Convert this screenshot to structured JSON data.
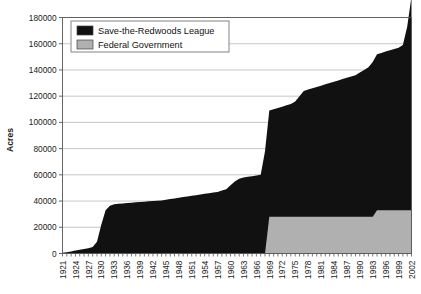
{
  "chart_data": {
    "type": "area",
    "title": "",
    "subtitle": "",
    "xlabel": "",
    "ylabel": "Acres",
    "stacked": true,
    "grid": true,
    "grid_axis": "y",
    "legend_position": "top-left",
    "xlim": [
      1921,
      2002
    ],
    "ylim": [
      0,
      180000
    ],
    "ytick_labels": [
      "0",
      "20000",
      "40000",
      "60000",
      "80000",
      "100000",
      "120000",
      "140000",
      "160000",
      "180000"
    ],
    "ytick_values": [
      0,
      20000,
      40000,
      60000,
      80000,
      100000,
      120000,
      140000,
      160000,
      180000
    ],
    "xtick_labels": [
      "1921",
      "1924",
      "1927",
      "1930",
      "1933",
      "1936",
      "1939",
      "1942",
      "1945",
      "1948",
      "1951",
      "1954",
      "1957",
      "1960",
      "1963",
      "1966",
      "1969",
      "1972",
      "1975",
      "1978",
      "1981",
      "1984",
      "1987",
      "1990",
      "1993",
      "1996",
      "1999",
      "2002"
    ],
    "xtick_interval": 3,
    "colors": {
      "save_the_redwoods_league": "#111111",
      "federal_government": "#b0b0b0",
      "grid": "#b8b8b8",
      "axis": "#555555",
      "background": "#ffffff"
    },
    "x": [
      1921,
      1922,
      1923,
      1924,
      1925,
      1926,
      1927,
      1928,
      1929,
      1930,
      1931,
      1932,
      1933,
      1934,
      1935,
      1936,
      1937,
      1938,
      1939,
      1940,
      1941,
      1942,
      1943,
      1944,
      1945,
      1946,
      1947,
      1948,
      1949,
      1950,
      1951,
      1952,
      1953,
      1954,
      1955,
      1956,
      1957,
      1958,
      1959,
      1960,
      1961,
      1962,
      1963,
      1964,
      1965,
      1966,
      1967,
      1968,
      1969,
      1970,
      1971,
      1972,
      1973,
      1974,
      1975,
      1976,
      1977,
      1978,
      1979,
      1980,
      1981,
      1982,
      1983,
      1984,
      1985,
      1986,
      1987,
      1988,
      1989,
      1990,
      1991,
      1992,
      1993,
      1994,
      1995,
      1996,
      1997,
      1998,
      1999,
      2000,
      2001,
      2002
    ],
    "series": [
      {
        "name": "Save-the-Redwoods League",
        "color": "#111111",
        "values": [
          500,
          900,
          1500,
          2200,
          2800,
          3400,
          4000,
          5000,
          9000,
          22000,
          33000,
          36500,
          37500,
          38000,
          38200,
          38500,
          38800,
          39000,
          39200,
          39500,
          39800,
          40000,
          40200,
          40500,
          41000,
          41500,
          42000,
          42500,
          43000,
          43500,
          44000,
          44500,
          45000,
          45500,
          46000,
          46500,
          47000,
          48000,
          49000,
          52000,
          55000,
          57000,
          58000,
          58500,
          59000,
          59500,
          60000,
          78000,
          81000,
          82000,
          83000,
          84000,
          85000,
          86000,
          88000,
          92000,
          96000,
          97000,
          98000,
          99000,
          100000,
          101000,
          102000,
          103000,
          104000,
          105000,
          106000,
          107000,
          108000,
          110000,
          112000,
          114000,
          118000,
          119000,
          120000,
          121000,
          122000,
          123000,
          124000,
          126000,
          140000,
          163000
        ]
      },
      {
        "name": "Federal Government",
        "color": "#b0b0b0",
        "values": [
          0,
          0,
          0,
          0,
          0,
          0,
          0,
          0,
          0,
          0,
          0,
          0,
          0,
          0,
          0,
          0,
          0,
          0,
          0,
          0,
          0,
          0,
          0,
          0,
          0,
          0,
          0,
          0,
          0,
          0,
          0,
          0,
          0,
          0,
          0,
          0,
          0,
          0,
          0,
          0,
          0,
          0,
          0,
          0,
          0,
          0,
          0,
          0,
          28000,
          28000,
          28000,
          28000,
          28000,
          28000,
          28000,
          28000,
          28000,
          28000,
          28000,
          28000,
          28000,
          28000,
          28000,
          28000,
          28000,
          28000,
          28000,
          28000,
          28000,
          28000,
          28000,
          28000,
          28000,
          33000,
          33000,
          33000,
          33000,
          33000,
          33000,
          33000,
          33000,
          33000
        ]
      }
    ],
    "notes": {
      "federal_plateau_acres": 78000,
      "federal_start_year": 1968,
      "final_total_acres": 163000
    }
  },
  "legend": {
    "items": [
      {
        "label": "Save-the-Redwoods League",
        "swatch": "#111111"
      },
      {
        "label": "Federal Government",
        "swatch": "#b0b0b0"
      }
    ]
  }
}
